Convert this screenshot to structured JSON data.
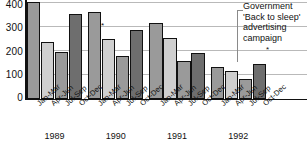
{
  "chart_data": {
    "type": "bar",
    "title": "",
    "xlabel": "",
    "ylabel": "",
    "ylim": [
      0,
      400
    ],
    "yticks": [
      "0",
      "100",
      "200",
      "300",
      "400"
    ],
    "grid": true,
    "legend": "none",
    "groups": [
      "1989",
      "1990",
      "1991",
      "1992"
    ],
    "categories": [
      "Jan-Mar",
      "Apr-Jun",
      "Jul-Sep",
      "Oct-Dec"
    ],
    "bars": [
      {
        "group": "1989",
        "category": "Jan-Mar",
        "value": 400,
        "tone": "tone-mid"
      },
      {
        "group": "1989",
        "category": "Apr-Jun",
        "value": 235,
        "tone": "tone-light"
      },
      {
        "group": "1989",
        "category": "Jul-Sep",
        "value": 192,
        "tone": "tone-mid"
      },
      {
        "group": "1989",
        "category": "Oct-Dec",
        "value": 350,
        "tone": "tone-dark"
      },
      {
        "group": "1990",
        "category": "Jan-Mar",
        "value": 357,
        "tone": "tone-mid"
      },
      {
        "group": "1990",
        "category": "Apr-Jun",
        "value": 248,
        "tone": "tone-light"
      },
      {
        "group": "1990",
        "category": "Jul-Sep",
        "value": 178,
        "tone": "tone-mid"
      },
      {
        "group": "1990",
        "category": "Oct-Dec",
        "value": 283,
        "tone": "tone-dark"
      },
      {
        "group": "1991",
        "category": "Jan-Mar",
        "value": 312,
        "tone": "tone-mid"
      },
      {
        "group": "1991",
        "category": "Apr-Jun",
        "value": 253,
        "tone": "tone-light"
      },
      {
        "group": "1991",
        "category": "Jul-Sep",
        "value": 155,
        "tone": "tone-mid"
      },
      {
        "group": "1991",
        "category": "Oct-Dec",
        "value": 190,
        "tone": "tone-dark"
      },
      {
        "group": "1992",
        "category": "Jan-Mar",
        "value": 133,
        "tone": "tone-mid"
      },
      {
        "group": "1992",
        "category": "Apr-Jun",
        "value": 117,
        "tone": "tone-light"
      },
      {
        "group": "1992",
        "category": "Jul-Sep",
        "value": 82,
        "tone": "tone-mid"
      },
      {
        "group": "1992",
        "category": "Oct-Dec",
        "value": 145,
        "tone": "tone-dark"
      }
    ],
    "annotations": [
      {
        "name": "campaign-callout",
        "lines": [
          "Government",
          "'Back to sleep'",
          "advertising",
          "campaign"
        ],
        "marker": "*",
        "points_to": {
          "group": "1992",
          "category": "Jan-Mar"
        }
      },
      {
        "name": "plot-marker-1",
        "marker": "*"
      }
    ]
  },
  "colors": {
    "tone_mid": "#9a9a9a",
    "tone_light": "#cfcfcf",
    "tone_dark": "#6e6e6e",
    "axis": "#111111",
    "gridline": "#b9b9b9",
    "leader": "#8a8a8a"
  }
}
